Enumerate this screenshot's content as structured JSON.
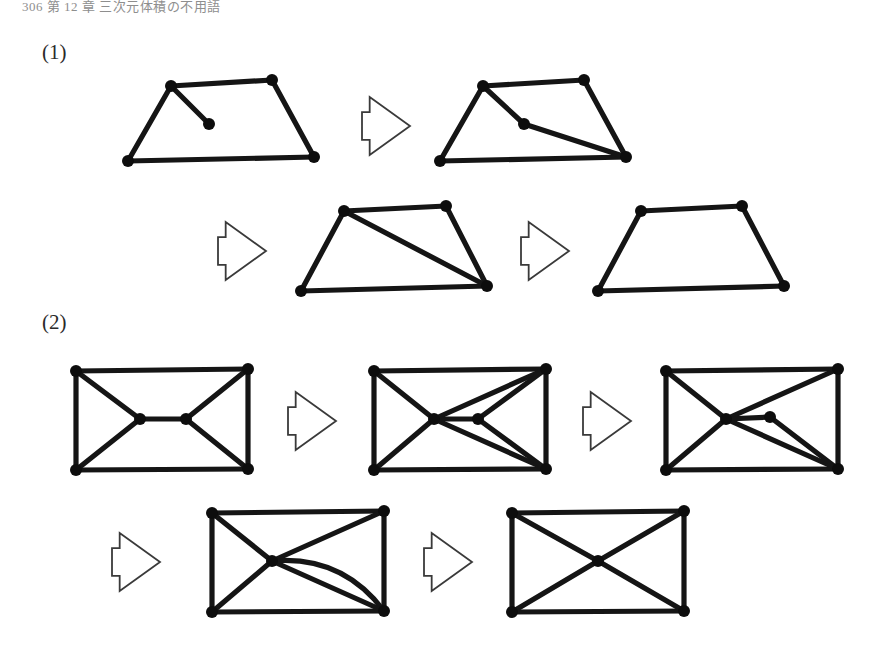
{
  "page": {
    "header_text": "306  第 12 章  三次元体積の不用語",
    "background": "#ffffff",
    "ink_color": "#0d0d0d",
    "arrow_outline_color": "#3a3a3a"
  },
  "items": [
    {
      "id": "item-1",
      "label": "(1)"
    },
    {
      "id": "item-2",
      "label": "(2)"
    }
  ],
  "figure": {
    "node_radius": 6,
    "edge_width": 5.2,
    "groups": [
      {
        "name": "sequence-1",
        "steps": [
          {
            "name": "graph-1a",
            "nodes": [
              {
                "id": "tl",
                "x": 171,
                "y": 86
              },
              {
                "id": "tr",
                "x": 272,
                "y": 80
              },
              {
                "id": "bl",
                "x": 128,
                "y": 161
              },
              {
                "id": "br",
                "x": 314,
                "y": 157
              },
              {
                "id": "mid",
                "x": 209,
                "y": 124
              }
            ],
            "edges": [
              {
                "from": "tl",
                "to": "tr"
              },
              {
                "from": "tl",
                "to": "bl"
              },
              {
                "from": "tr",
                "to": "br"
              },
              {
                "from": "bl",
                "to": "br"
              },
              {
                "from": "tl",
                "to": "mid"
              }
            ],
            "curved_edges": []
          },
          {
            "name": "graph-1b",
            "nodes": [
              {
                "id": "tl",
                "x": 483,
                "y": 86
              },
              {
                "id": "tr",
                "x": 584,
                "y": 80
              },
              {
                "id": "bl",
                "x": 440,
                "y": 161
              },
              {
                "id": "br",
                "x": 626,
                "y": 157
              },
              {
                "id": "mid",
                "x": 524,
                "y": 124
              }
            ],
            "edges": [
              {
                "from": "tl",
                "to": "tr"
              },
              {
                "from": "tl",
                "to": "bl"
              },
              {
                "from": "tr",
                "to": "br"
              },
              {
                "from": "bl",
                "to": "br"
              },
              {
                "from": "tl",
                "to": "mid"
              },
              {
                "from": "mid",
                "to": "br"
              }
            ],
            "curved_edges": []
          },
          {
            "name": "graph-1c",
            "nodes": [
              {
                "id": "tl",
                "x": 344,
                "y": 211
              },
              {
                "id": "tr",
                "x": 446,
                "y": 206
              },
              {
                "id": "bl",
                "x": 301,
                "y": 291
              },
              {
                "id": "br",
                "x": 487,
                "y": 286
              }
            ],
            "edges": [
              {
                "from": "tl",
                "to": "tr"
              },
              {
                "from": "tl",
                "to": "bl"
              },
              {
                "from": "tr",
                "to": "br"
              },
              {
                "from": "bl",
                "to": "br"
              },
              {
                "from": "tl",
                "to": "br"
              }
            ],
            "curved_edges": []
          },
          {
            "name": "graph-1d",
            "nodes": [
              {
                "id": "tl",
                "x": 641,
                "y": 211
              },
              {
                "id": "tr",
                "x": 742,
                "y": 206
              },
              {
                "id": "bl",
                "x": 598,
                "y": 291
              },
              {
                "id": "br",
                "x": 784,
                "y": 286
              }
            ],
            "edges": [
              {
                "from": "tl",
                "to": "tr"
              },
              {
                "from": "tl",
                "to": "bl"
              },
              {
                "from": "tr",
                "to": "br"
              },
              {
                "from": "bl",
                "to": "br"
              }
            ],
            "curved_edges": []
          }
        ],
        "arrows": [
          {
            "name": "arrow-1-1",
            "x": 362,
            "y": 97,
            "w": 48,
            "h": 58
          },
          {
            "name": "arrow-1-2",
            "x": 218,
            "y": 222,
            "w": 48,
            "h": 58
          },
          {
            "name": "arrow-1-3",
            "x": 521,
            "y": 222,
            "w": 48,
            "h": 58
          }
        ]
      },
      {
        "name": "sequence-2",
        "steps": [
          {
            "name": "graph-2a",
            "nodes": [
              {
                "id": "tl",
                "x": 76,
                "y": 371
              },
              {
                "id": "tr",
                "x": 248,
                "y": 369
              },
              {
                "id": "bl",
                "x": 76,
                "y": 470
              },
              {
                "id": "br",
                "x": 248,
                "y": 469
              },
              {
                "id": "ml",
                "x": 140,
                "y": 419
              },
              {
                "id": "mr",
                "x": 186,
                "y": 419
              }
            ],
            "edges": [
              {
                "from": "tl",
                "to": "tr"
              },
              {
                "from": "tl",
                "to": "bl"
              },
              {
                "from": "tr",
                "to": "br"
              },
              {
                "from": "bl",
                "to": "br"
              },
              {
                "from": "tl",
                "to": "ml"
              },
              {
                "from": "bl",
                "to": "ml"
              },
              {
                "from": "tr",
                "to": "mr"
              },
              {
                "from": "br",
                "to": "mr"
              },
              {
                "from": "ml",
                "to": "mr"
              }
            ],
            "curved_edges": []
          },
          {
            "name": "graph-2b",
            "nodes": [
              {
                "id": "tl",
                "x": 374,
                "y": 371
              },
              {
                "id": "tr",
                "x": 546,
                "y": 369
              },
              {
                "id": "bl",
                "x": 374,
                "y": 470
              },
              {
                "id": "br",
                "x": 546,
                "y": 469
              },
              {
                "id": "c",
                "x": 434,
                "y": 419
              },
              {
                "id": "mr",
                "x": 478,
                "y": 419
              }
            ],
            "edges": [
              {
                "from": "tl",
                "to": "tr"
              },
              {
                "from": "tl",
                "to": "bl"
              },
              {
                "from": "tr",
                "to": "br"
              },
              {
                "from": "bl",
                "to": "br"
              },
              {
                "from": "tl",
                "to": "c"
              },
              {
                "from": "bl",
                "to": "c"
              },
              {
                "from": "tr",
                "to": "c"
              },
              {
                "from": "br",
                "to": "c"
              },
              {
                "from": "c",
                "to": "mr"
              },
              {
                "from": "mr",
                "to": "tr"
              },
              {
                "from": "mr",
                "to": "br"
              }
            ],
            "curved_edges": []
          },
          {
            "name": "graph-2c",
            "nodes": [
              {
                "id": "tl",
                "x": 666,
                "y": 371
              },
              {
                "id": "tr",
                "x": 838,
                "y": 369
              },
              {
                "id": "bl",
                "x": 666,
                "y": 470
              },
              {
                "id": "br",
                "x": 838,
                "y": 469
              },
              {
                "id": "c",
                "x": 726,
                "y": 419
              },
              {
                "id": "mr",
                "x": 770,
                "y": 417
              }
            ],
            "edges": [
              {
                "from": "tl",
                "to": "tr"
              },
              {
                "from": "tl",
                "to": "bl"
              },
              {
                "from": "tr",
                "to": "br"
              },
              {
                "from": "bl",
                "to": "br"
              },
              {
                "from": "tl",
                "to": "c"
              },
              {
                "from": "bl",
                "to": "c"
              },
              {
                "from": "tr",
                "to": "c"
              },
              {
                "from": "br",
                "to": "c"
              },
              {
                "from": "c",
                "to": "mr"
              },
              {
                "from": "mr",
                "to": "br"
              }
            ],
            "curved_edges": []
          },
          {
            "name": "graph-2d",
            "nodes": [
              {
                "id": "tl",
                "x": 212,
                "y": 513
              },
              {
                "id": "tr",
                "x": 384,
                "y": 511
              },
              {
                "id": "bl",
                "x": 212,
                "y": 612
              },
              {
                "id": "br",
                "x": 384,
                "y": 611
              },
              {
                "id": "c",
                "x": 272,
                "y": 561
              }
            ],
            "edges": [
              {
                "from": "tl",
                "to": "tr"
              },
              {
                "from": "tl",
                "to": "bl"
              },
              {
                "from": "tr",
                "to": "br"
              },
              {
                "from": "bl",
                "to": "br"
              },
              {
                "from": "tl",
                "to": "c"
              },
              {
                "from": "bl",
                "to": "c"
              },
              {
                "from": "tr",
                "to": "c"
              },
              {
                "from": "br",
                "to": "c"
              }
            ],
            "curved_edges": [
              {
                "from": "c",
                "to": "br",
                "bow": -34
              }
            ]
          },
          {
            "name": "graph-2e",
            "nodes": [
              {
                "id": "tl",
                "x": 512,
                "y": 513
              },
              {
                "id": "tr",
                "x": 684,
                "y": 511
              },
              {
                "id": "bl",
                "x": 512,
                "y": 612
              },
              {
                "id": "br",
                "x": 684,
                "y": 611
              },
              {
                "id": "c",
                "x": 598,
                "y": 561
              }
            ],
            "edges": [
              {
                "from": "tl",
                "to": "tr"
              },
              {
                "from": "tl",
                "to": "bl"
              },
              {
                "from": "tr",
                "to": "br"
              },
              {
                "from": "bl",
                "to": "br"
              },
              {
                "from": "tl",
                "to": "c"
              },
              {
                "from": "bl",
                "to": "c"
              },
              {
                "from": "tr",
                "to": "c"
              },
              {
                "from": "br",
                "to": "c"
              }
            ],
            "curved_edges": []
          }
        ],
        "arrows": [
          {
            "name": "arrow-2-1",
            "x": 288,
            "y": 392,
            "w": 48,
            "h": 58
          },
          {
            "name": "arrow-2-2",
            "x": 583,
            "y": 392,
            "w": 48,
            "h": 58
          },
          {
            "name": "arrow-2-3",
            "x": 112,
            "y": 533,
            "w": 48,
            "h": 58
          },
          {
            "name": "arrow-2-4",
            "x": 424,
            "y": 533,
            "w": 48,
            "h": 58
          }
        ]
      }
    ]
  }
}
